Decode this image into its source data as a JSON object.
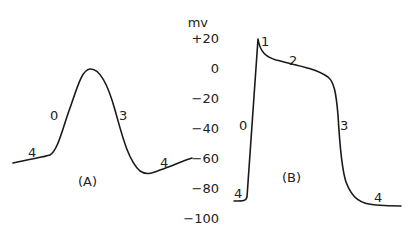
{
  "chart_data": {
    "type": "line",
    "title": "",
    "ylabel": "mv",
    "y_unit": "mV",
    "ylim": [
      -100,
      20
    ],
    "y_ticks": [
      "+20",
      "0",
      "−20",
      "−40",
      "−60",
      "−80",
      "−100"
    ],
    "y_tick_values": [
      20,
      0,
      -20,
      -40,
      -60,
      -80,
      -100
    ],
    "panels": [
      {
        "name": "(A)",
        "description": "slow-response action potential",
        "phase_labels": [
          "4",
          "0",
          "3",
          "4"
        ],
        "points_mV": [
          -63,
          -58,
          -30,
          -1,
          -30,
          -62,
          -70,
          -60
        ]
      },
      {
        "name": "(B)",
        "description": "fast-response action potential",
        "phase_labels": [
          "4",
          "0",
          "1",
          "2",
          "3",
          "4"
        ],
        "points_mV": [
          -89,
          -89,
          19,
          6,
          2,
          -2,
          -20,
          -60,
          -88,
          -92,
          -92
        ]
      }
    ]
  }
}
